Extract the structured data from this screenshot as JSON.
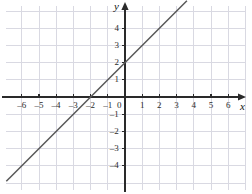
{
  "chart_data": {
    "type": "line",
    "title": "",
    "xlabel": "x",
    "ylabel": "y",
    "xlim": [
      -6.9,
      7.0
    ],
    "ylim": [
      -5.3,
      5.6
    ],
    "grid": true,
    "grid_step": 1,
    "legend": "none",
    "equation": "y = x + 2",
    "slope": 1,
    "y_intercept": 2,
    "x_intercept": -2,
    "series": [
      {
        "name": "y = x + 2",
        "x": [
          -6.9,
          3.6
        ],
        "values": [
          -4.9,
          5.6
        ],
        "color": "#585858"
      }
    ],
    "points_of_interest": [
      {
        "label": "y-intercept",
        "x": 0,
        "y": 2
      },
      {
        "label": "x-intercept",
        "x": -2,
        "y": 0
      }
    ],
    "xticks": [
      -6,
      -5,
      -4,
      -3,
      -2,
      -1,
      1,
      2,
      3,
      4,
      5,
      6
    ],
    "xtick_labels": [
      "–6",
      "–5",
      "–4",
      "–3",
      "–2",
      "–1",
      "1",
      "2",
      "3",
      "4",
      "5",
      "6"
    ],
    "yticks": [
      4,
      3,
      2,
      1,
      -1,
      -2,
      -3,
      -4
    ],
    "ytick_labels": [
      "4",
      "3",
      "2",
      "1",
      "–1",
      "–2",
      "–3",
      "–4"
    ],
    "origin_label": "0",
    "colors": {
      "grid": "#d9d9e2",
      "axis": "#2a2a2a",
      "line": "#585858",
      "text": "#2b2b2b",
      "background": "#ffffff"
    }
  }
}
